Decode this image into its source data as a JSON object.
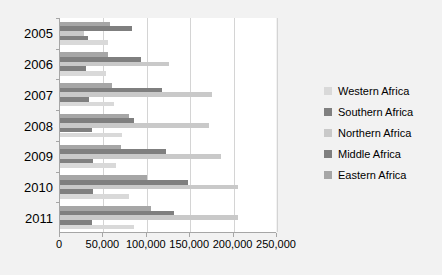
{
  "chart_data": {
    "type": "bar",
    "orientation": "horizontal",
    "title": "",
    "xlabel": "",
    "ylabel": "",
    "xlim": [
      0,
      250000
    ],
    "grid": true,
    "legend_position": "right",
    "categories": [
      "2005",
      "2006",
      "2007",
      "2008",
      "2009",
      "2010",
      "2011"
    ],
    "xticks": [
      "0",
      "50,000",
      "100,000",
      "150,000",
      "200,000",
      "250,000"
    ],
    "xtick_values": [
      0,
      50000,
      100000,
      150000,
      200000,
      250000
    ],
    "series": [
      {
        "name": "Western Africa",
        "color": "#d9d9d9",
        "values": [
          55000,
          53000,
          62000,
          71000,
          65000,
          80000,
          85000
        ]
      },
      {
        "name": "Southern Africa",
        "color": "#808080",
        "values": [
          32000,
          30000,
          33000,
          37000,
          38000,
          38000,
          37000
        ]
      },
      {
        "name": "Northern Africa",
        "color": "#c9c9c9",
        "values": [
          28000,
          125000,
          175000,
          172000,
          185000,
          205000,
          205000
        ]
      },
      {
        "name": "Middle Africa",
        "color": "#7f7f7f",
        "values": [
          83000,
          93000,
          117000,
          85000,
          122000,
          148000,
          131000
        ]
      },
      {
        "name": "Eastern Africa",
        "color": "#a6a6a6",
        "values": [
          58000,
          55000,
          60000,
          80000,
          70000,
          100000,
          105000
        ]
      }
    ]
  },
  "legend": {
    "items": [
      {
        "label": "Western Africa"
      },
      {
        "label": "Southern Africa"
      },
      {
        "label": "Northern Africa"
      },
      {
        "label": "Middle Africa"
      },
      {
        "label": "Eastern Africa"
      }
    ]
  }
}
